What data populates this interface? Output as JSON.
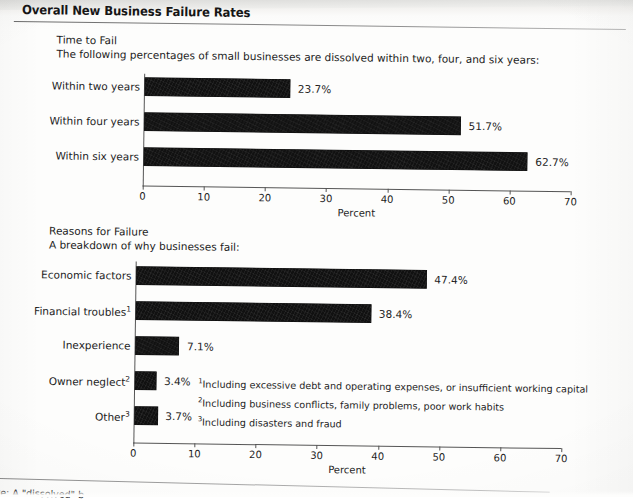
{
  "page": {
    "title": "Overall New Business Failure Rates",
    "bottom_note": "ote: A \"dissolved\" b"
  },
  "section_top": {
    "heading": "Time to Fail",
    "subheading": "The following percentages of small businesses are dissolved within two, four, and six years:"
  },
  "section_bottom": {
    "heading": "Reasons for Failure",
    "subheading": "A breakdown of why businesses fail:"
  },
  "footnotes": [
    {
      "marker": "1",
      "text": "Including excessive debt and operating expenses, or insufficient working capital"
    },
    {
      "marker": "2",
      "text": "Including business conflicts, family problems, poor work habits"
    },
    {
      "marker": "3",
      "text": "Including disasters and fraud"
    }
  ],
  "chart_data": [
    {
      "type": "bar",
      "orientation": "horizontal",
      "title": "Time to Fail",
      "xlabel": "Percent",
      "ylabel": "",
      "xlim": [
        0,
        70
      ],
      "xticks": [
        0,
        10,
        20,
        30,
        40,
        50,
        60,
        70
      ],
      "grid": false,
      "legend": "none",
      "bar_color": "#111111",
      "categories": [
        "Within two years",
        "Within four years",
        "Within six years"
      ],
      "values": [
        23.7,
        51.7,
        62.7
      ],
      "value_labels": [
        "23.7%",
        "51.7%",
        "62.7%"
      ]
    },
    {
      "type": "bar",
      "orientation": "horizontal",
      "title": "Reasons for Failure",
      "xlabel": "Percent",
      "ylabel": "",
      "xlim": [
        0,
        70
      ],
      "xticks": [
        0,
        10,
        20,
        30,
        40,
        50,
        60,
        70
      ],
      "grid": false,
      "legend": "none",
      "bar_color": "#111111",
      "categories": [
        "Economic factors",
        "Financial troubles",
        "Inexperience",
        "Owner neglect",
        "Other"
      ],
      "category_markers": [
        "",
        "1",
        "",
        "2",
        "3"
      ],
      "values": [
        47.4,
        38.4,
        7.1,
        3.4,
        3.7
      ],
      "value_labels": [
        "47.4%",
        "38.4%",
        "7.1%",
        "3.4%",
        "3.7%"
      ]
    }
  ]
}
